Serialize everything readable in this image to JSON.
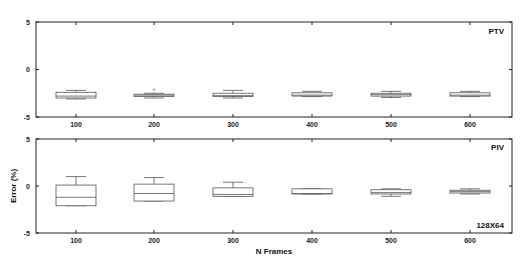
{
  "chart_data": [
    {
      "type": "box",
      "title": "PTV",
      "panel_label": "PTV",
      "xlabel": "",
      "ylabel": "",
      "categories": [
        "100",
        "200",
        "300",
        "400",
        "500",
        "600"
      ],
      "ylim": [
        -5,
        5
      ],
      "yticks": [
        "5",
        "0",
        "-5"
      ],
      "grid": false,
      "series": [
        {
          "name": "PTV",
          "boxes": [
            {
              "x": "100",
              "whisker_high": -2.2,
              "q3": -2.4,
              "median": -2.8,
              "q1": -3.0,
              "whisker_low": -3.1
            },
            {
              "x": "200",
              "whisker_high": -2.5,
              "q3": -2.6,
              "median": -2.7,
              "q1": -2.85,
              "whisker_low": -3.0,
              "outliers": [
                -2.1
              ]
            },
            {
              "x": "300",
              "whisker_high": -2.2,
              "q3": -2.5,
              "median": -2.75,
              "q1": -2.85,
              "whisker_low": -3.0
            },
            {
              "x": "400",
              "whisker_high": -2.3,
              "q3": -2.45,
              "median": -2.7,
              "q1": -2.8,
              "whisker_low": -2.85
            },
            {
              "x": "500",
              "whisker_high": -2.3,
              "q3": -2.5,
              "median": -2.65,
              "q1": -2.8,
              "whisker_low": -2.95
            },
            {
              "x": "600",
              "whisker_high": -2.3,
              "q3": -2.45,
              "median": -2.7,
              "q1": -2.8,
              "whisker_low": -2.85
            }
          ]
        }
      ]
    },
    {
      "type": "box",
      "title": "PIV",
      "panel_label": "PIV",
      "annotation": "128X64",
      "xlabel": "N Frames",
      "ylabel": "Error (%)",
      "categories": [
        "100",
        "200",
        "300",
        "400",
        "500",
        "600"
      ],
      "ylim": [
        -5,
        5
      ],
      "yticks": [
        "5",
        "0",
        "-5"
      ],
      "grid": false,
      "series": [
        {
          "name": "PIV",
          "boxes": [
            {
              "x": "100",
              "whisker_high": 1.0,
              "q3": 0.1,
              "median": -1.2,
              "q1": -2.1,
              "whisker_low": -2.1
            },
            {
              "x": "200",
              "whisker_high": 0.9,
              "q3": 0.2,
              "median": -0.8,
              "q1": -1.6,
              "whisker_low": -1.6
            },
            {
              "x": "300",
              "whisker_high": 0.4,
              "q3": -0.2,
              "median": -0.9,
              "q1": -1.1,
              "whisker_low": -1.1
            },
            {
              "x": "400",
              "whisker_high": -0.3,
              "q3": -0.3,
              "median": -0.8,
              "q1": -0.85,
              "whisker_low": -0.85
            },
            {
              "x": "500",
              "whisker_high": -0.3,
              "q3": -0.4,
              "median": -0.7,
              "q1": -0.85,
              "whisker_low": -1.1
            },
            {
              "x": "600",
              "whisker_high": -0.3,
              "q3": -0.45,
              "median": -0.6,
              "q1": -0.75,
              "whisker_low": -0.85
            }
          ]
        }
      ]
    }
  ],
  "labels": {
    "top_panel": "PTV",
    "bottom_panel": "PIV",
    "resolution": "128X64",
    "xlabel": "N Frames",
    "ylabel": "Error (%)",
    "y_top": "5",
    "y_mid": "0",
    "y_bottom": "-5",
    "x_ticks": [
      "100",
      "200",
      "300",
      "400",
      "500",
      "600"
    ]
  }
}
